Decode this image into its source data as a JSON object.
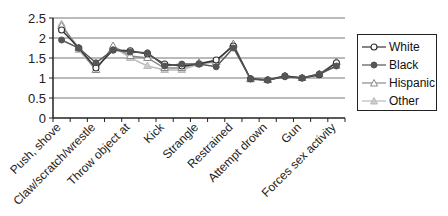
{
  "chart_data": {
    "type": "line",
    "title": "",
    "xlabel": "",
    "ylabel": "",
    "ylim": [
      0,
      2.5
    ],
    "yticks": [
      0,
      0.5,
      1,
      1.5,
      2,
      2.5
    ],
    "grid": true,
    "legend_position": "right",
    "categories": [
      "Push, shove",
      "",
      "Claw/scratch/wrestle",
      "",
      "Throw object at",
      "",
      "Kick",
      "",
      "Strangle",
      "",
      "Restrained",
      "",
      "Attempt drown",
      "",
      "Gun",
      "",
      "Forces sex activity"
    ],
    "tick_labels": [
      "Push, shove",
      "Claw/scratch/wrestle",
      "Throw object at",
      "Kick",
      "Strangle",
      "Restrained",
      "Attempt drown",
      "Gun",
      "Forces sex activity"
    ],
    "series": [
      {
        "name": "White",
        "color": "#333333",
        "marker": "open-circle",
        "values": [
          2.2,
          1.75,
          1.25,
          1.7,
          1.68,
          1.6,
          1.35,
          1.3,
          1.35,
          1.45,
          1.8,
          0.98,
          0.95,
          1.05,
          1.0,
          1.08,
          1.38
        ]
      },
      {
        "name": "Black",
        "color": "#555555",
        "marker": "filled-circle",
        "values": [
          1.95,
          1.75,
          1.38,
          1.7,
          1.65,
          1.63,
          1.3,
          1.35,
          1.35,
          1.28,
          1.75,
          0.98,
          0.95,
          1.03,
          1.0,
          1.1,
          1.3
        ]
      },
      {
        "name": "Hispanic",
        "color": "#888888",
        "marker": "open-triangle",
        "values": [
          2.3,
          1.75,
          1.2,
          1.8,
          1.55,
          1.5,
          1.25,
          1.25,
          1.38,
          1.4,
          1.85,
          0.97,
          0.95,
          1.05,
          1.0,
          1.1,
          1.4
        ]
      },
      {
        "name": "Other",
        "color": "#bbbbbb",
        "marker": "filled-triangle",
        "values": [
          2.35,
          1.7,
          1.2,
          1.78,
          1.5,
          1.3,
          1.2,
          1.2,
          1.35,
          1.4,
          1.82,
          0.97,
          0.95,
          1.05,
          1.0,
          1.08,
          1.3
        ]
      }
    ]
  }
}
